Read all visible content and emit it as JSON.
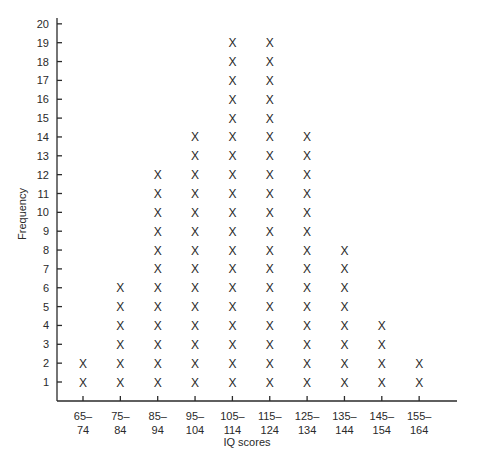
{
  "chart_data": {
    "type": "dot_plot",
    "title": "",
    "xlabel": "IQ scores",
    "ylabel": "Frequency",
    "marker": "X",
    "categories": [
      "65–74",
      "75–84",
      "85–94",
      "95–104",
      "105–114",
      "115–124",
      "125–134",
      "135–144",
      "145–154",
      "155–164"
    ],
    "category_lines": [
      [
        "65–",
        "74"
      ],
      [
        "75–",
        "84"
      ],
      [
        "85–",
        "94"
      ],
      [
        "95–",
        "104"
      ],
      [
        "105–",
        "114"
      ],
      [
        "115–",
        "124"
      ],
      [
        "125–",
        "134"
      ],
      [
        "135–",
        "144"
      ],
      [
        "145–",
        "154"
      ],
      [
        "155–",
        "164"
      ]
    ],
    "values": [
      2,
      6,
      12,
      14,
      19,
      19,
      14,
      8,
      4,
      2
    ],
    "y_ticks": [
      1,
      2,
      3,
      4,
      5,
      6,
      7,
      8,
      9,
      10,
      11,
      12,
      13,
      14,
      15,
      16,
      17,
      18,
      19,
      20
    ],
    "ylim": [
      0,
      20
    ],
    "grid": false,
    "legend": null
  },
  "colors": {
    "ink": "#2a2a2a",
    "background": "#ffffff"
  }
}
